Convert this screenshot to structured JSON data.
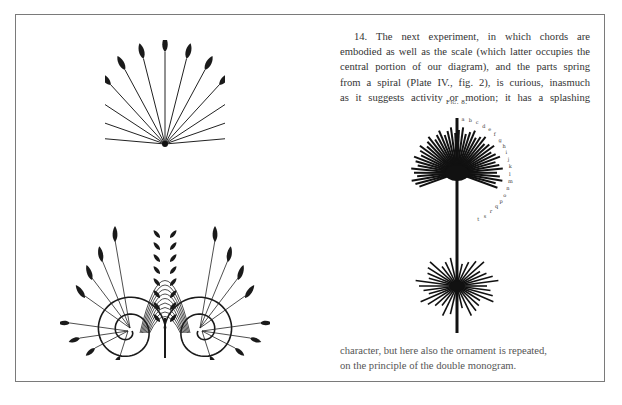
{
  "page": {
    "background": "#ffffff",
    "frame_color": "#7a7a7a"
  },
  "text": {
    "top_paragraph_lines": [
      "14. The next experiment, in which chords are",
      "embodied as well as the scale (which latter occupies the",
      "central portion of our diagram), and the parts spring",
      "from a spiral (Plate IV., fig. 2), is curious, inasmuch",
      "as it suggests activity or motion; it has a splashing"
    ],
    "figure_caption": "Fig. 8.",
    "bottom_paragraph_lines": [
      "character, but here also the ornament is repeated,",
      "on the principle of the double monogram."
    ]
  },
  "figures": [
    {
      "id": "fan-ornament",
      "description": "Fan of leaf-tipped rays radiating from a single point"
    },
    {
      "id": "double-spiral-ornament",
      "description": "Symmetrical ornament of leaves springing from two spirals"
    },
    {
      "id": "fig-8-splash",
      "description": "Two radiating bursts of lines joined by a vertical stem, with letter labels"
    }
  ]
}
